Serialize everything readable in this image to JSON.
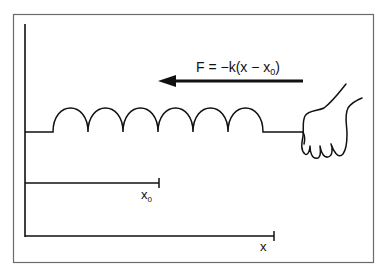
{
  "diagram": {
    "force_label": {
      "prefix": "F = −k(x − x",
      "subscript": "0",
      "suffix": ")"
    },
    "equilibrium_label": {
      "base": "x",
      "subscript": "0"
    },
    "displacement_label": "x",
    "colors": {
      "frame": "#6b6b6b",
      "stroke": "#111111",
      "background": "#ffffff"
    },
    "elements": [
      "frame-border",
      "wall-vertical-axis",
      "spring-coil",
      "force-arrow",
      "hand",
      "equilibrium-ruler",
      "displacement-ruler"
    ],
    "spring": {
      "coils": 6
    }
  }
}
